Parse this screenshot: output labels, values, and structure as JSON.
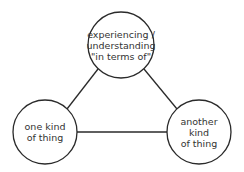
{
  "diagram": {
    "type": "triangle-concept-map",
    "nodes": [
      {
        "id": "top",
        "label": "experiencing /\nunderstanding\n\"in terms of\"",
        "cx": 121,
        "cy": 45,
        "r": 33
      },
      {
        "id": "left",
        "label": "one kind\nof thing",
        "cx": 45,
        "cy": 132,
        "r": 32
      },
      {
        "id": "right",
        "label": "another\nkind\nof thing",
        "cx": 199,
        "cy": 132,
        "r": 32
      }
    ],
    "edges": [
      {
        "from": "top",
        "to": "left"
      },
      {
        "from": "top",
        "to": "right"
      },
      {
        "from": "left",
        "to": "right"
      }
    ],
    "colors": {
      "stroke": "#2a2a2a",
      "text": "#333333",
      "background": "#ffffff"
    }
  }
}
